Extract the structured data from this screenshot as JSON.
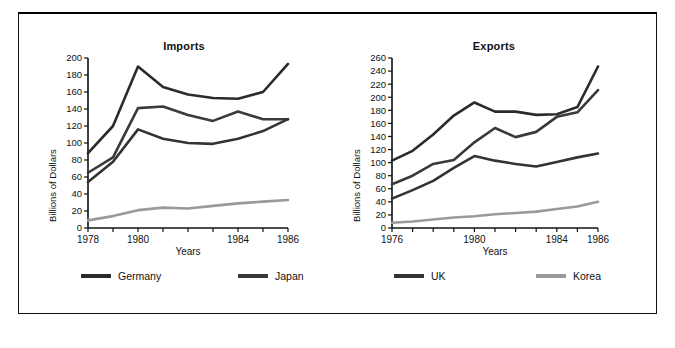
{
  "figure": {
    "background": "#ffffff",
    "frame_color": "#111111"
  },
  "legend": {
    "position": "bottom",
    "items": [
      {
        "label": "Germany",
        "color": "#2b2b2b"
      },
      {
        "label": "Japan",
        "color": "#3a3a3a"
      },
      {
        "label": "UK",
        "color": "#333333"
      },
      {
        "label": "Korea",
        "color": "#9a9a9a"
      }
    ]
  },
  "chart_data": [
    {
      "type": "line",
      "title": "Imports",
      "xlabel": "Years",
      "ylabel": "Billions of Dollars",
      "x": [
        1978,
        1979,
        1980,
        1981,
        1982,
        1983,
        1984,
        1985,
        1986
      ],
      "xlim": [
        1978,
        1986
      ],
      "ylim": [
        0,
        200
      ],
      "yticks": [
        0,
        20,
        40,
        60,
        80,
        100,
        120,
        140,
        160,
        180,
        200
      ],
      "xticks": [
        1978,
        1979,
        1980,
        1981,
        1982,
        1983,
        1984,
        1985,
        1986
      ],
      "xtick_labels": [
        "1978",
        "",
        "1980",
        "",
        "",
        "",
        "1984",
        "",
        "1986"
      ],
      "grid": false,
      "series": [
        {
          "name": "Germany",
          "color": "#2b2b2b",
          "values": [
            88,
            120,
            190,
            166,
            157,
            153,
            152,
            160,
            193
          ]
        },
        {
          "name": "Japan",
          "color": "#3a3a3a",
          "values": [
            65,
            83,
            141,
            143,
            133,
            126,
            137,
            128,
            128
          ]
        },
        {
          "name": "UK",
          "color": "#333333",
          "values": [
            54,
            78,
            116,
            105,
            100,
            99,
            105,
            114,
            128
          ]
        },
        {
          "name": "Korea",
          "color": "#9a9a9a",
          "values": [
            9,
            14,
            21,
            24,
            23,
            26,
            29,
            31,
            33
          ]
        }
      ]
    },
    {
      "type": "line",
      "title": "Exports",
      "xlabel": "Years",
      "ylabel": "Billions of Dollars",
      "x": [
        1976,
        1977,
        1978,
        1979,
        1980,
        1981,
        1982,
        1983,
        1984,
        1985,
        1986
      ],
      "xlim": [
        1976,
        1986
      ],
      "ylim": [
        0,
        260
      ],
      "yticks": [
        0,
        20,
        40,
        60,
        80,
        100,
        120,
        140,
        160,
        180,
        200,
        220,
        240,
        260
      ],
      "xticks": [
        1976,
        1977,
        1978,
        1979,
        1980,
        1981,
        1982,
        1983,
        1984,
        1985,
        1986
      ],
      "xtick_labels": [
        "1976",
        "",
        "",
        "",
        "1980",
        "",
        "",
        "",
        "1984",
        "",
        "1986"
      ],
      "grid": false,
      "series": [
        {
          "name": "Germany",
          "color": "#2b2b2b",
          "values": [
            103,
            118,
            143,
            172,
            192,
            178,
            178,
            173,
            174,
            185,
            247
          ]
        },
        {
          "name": "Japan",
          "color": "#3a3a3a",
          "values": [
            67,
            80,
            98,
            104,
            131,
            153,
            139,
            147,
            170,
            177,
            211
          ]
        },
        {
          "name": "UK",
          "color": "#333333",
          "values": [
            45,
            58,
            72,
            92,
            110,
            103,
            98,
            94,
            101,
            108,
            114
          ]
        },
        {
          "name": "Korea",
          "color": "#9a9a9a",
          "values": [
            8,
            10,
            13,
            16,
            18,
            21,
            23,
            25,
            29,
            33,
            40
          ]
        }
      ]
    }
  ]
}
